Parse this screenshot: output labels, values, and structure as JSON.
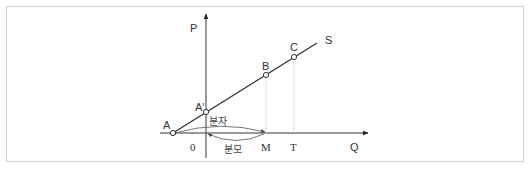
{
  "diagram": {
    "type": "supply-curve-elasticity",
    "axes": {
      "y_label": "P",
      "x_label": "Q",
      "origin_label": "0"
    },
    "curve_label": "S",
    "points": [
      {
        "id": "A",
        "label": "A"
      },
      {
        "id": "A_prime",
        "label": "A'"
      },
      {
        "id": "B",
        "label": "B"
      },
      {
        "id": "C",
        "label": "C"
      }
    ],
    "x_ticks": [
      {
        "id": "M",
        "label": "M"
      },
      {
        "id": "T",
        "label": "T"
      }
    ],
    "annotations": {
      "numerator": "분자",
      "denominator": "분모"
    },
    "colors": {
      "line": "#333333",
      "guide": "#bbbbbb",
      "border": "#cfcfcf"
    }
  }
}
